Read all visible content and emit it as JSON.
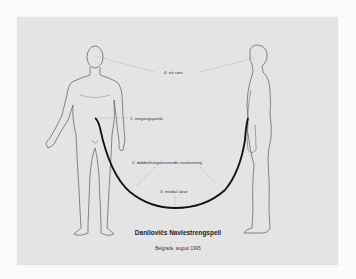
{
  "diagram": {
    "labels": {
      "sense": "4. ett sinn",
      "entry": "1. inngangspunkt",
      "cord": "2. dobbeltsingaliserende navlestreng",
      "axis": "3. medial akse"
    },
    "title": "Danilovičs Navlestrengspeil",
    "separator": "- - - -",
    "subtitle": "Belgrade, august 1995",
    "colors": {
      "background": "#fbfbfb",
      "panel": "#e4e4e4",
      "figure_outline": "#6a6a6a",
      "cord": "#111111",
      "leader_lines": "#888888"
    }
  }
}
